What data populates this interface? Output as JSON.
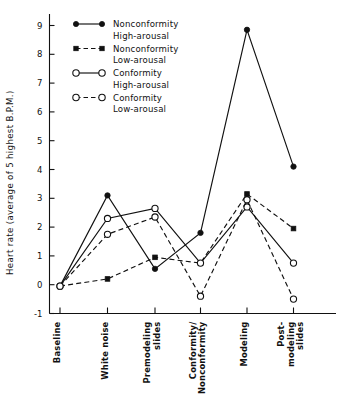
{
  "chart_data": {
    "type": "line",
    "title": "",
    "xlabel": "",
    "ylabel": "Heart rate (average of 5 highest B.P.M.)",
    "categories": [
      "Baseline",
      "White noise",
      "Premodeling slides",
      "Conformity/ Nonconformity",
      "Modeling",
      "Post- modeling slides"
    ],
    "category_lines": [
      [
        "Baseline"
      ],
      [
        "White noise"
      ],
      [
        "Premodeling",
        "slides"
      ],
      [
        "Conformity/",
        "Nonconformity"
      ],
      [
        "Modeling"
      ],
      [
        "Post-",
        "modeling",
        "slides"
      ]
    ],
    "ylim": [
      -1,
      9
    ],
    "ytick_labels": [
      "9",
      "8",
      "7",
      "6",
      "5",
      "4",
      "3",
      "2",
      "1",
      "0",
      "-1"
    ],
    "ytick_values": [
      9,
      8,
      7,
      6,
      5,
      4,
      3,
      2,
      1,
      0,
      -1
    ],
    "grid": false,
    "legend_position": "upper-left-inside",
    "series": [
      {
        "name": "Nonconformity High-arousal",
        "label_line1": "Nonconformity",
        "label_line2": "High-arousal",
        "marker": "filled-circle",
        "dash": "solid",
        "color": "#111111",
        "values": [
          -0.05,
          3.1,
          0.55,
          1.8,
          8.85,
          4.1
        ]
      },
      {
        "name": "Nonconformity Low-arousal",
        "label_line1": "Nonconformity",
        "label_line2": "Low-arousal",
        "marker": "filled-square",
        "dash": "dashed",
        "color": "#111111",
        "values": [
          -0.05,
          0.2,
          0.95,
          0.75,
          3.15,
          1.95
        ]
      },
      {
        "name": "Conformity High-arousal",
        "label_line1": "Conformity",
        "label_line2": "High-arousal",
        "marker": "open-circle",
        "dash": "solid",
        "color": "#111111",
        "values": [
          -0.05,
          2.3,
          2.65,
          0.75,
          2.7,
          0.75
        ]
      },
      {
        "name": "Conformity Low-arousal",
        "label_line1": "Conformity",
        "label_line2": "Low-arousal",
        "marker": "open-circle",
        "dash": "dashed",
        "color": "#111111",
        "values": [
          -0.05,
          1.75,
          2.35,
          -0.4,
          2.95,
          -0.5
        ]
      }
    ]
  },
  "axis": {
    "y_title": "Heart rate (average of 5 highest B.P.M.)"
  },
  "legend": {
    "entries": [
      {
        "line1": "Nonconformity",
        "line2": "High-arousal"
      },
      {
        "line1": "Nonconformity",
        "line2": "Low-arousal"
      },
      {
        "line1": "Conformity",
        "line2": "High-arousal"
      },
      {
        "line1": "Conformity",
        "line2": "Low-arousal"
      }
    ]
  }
}
